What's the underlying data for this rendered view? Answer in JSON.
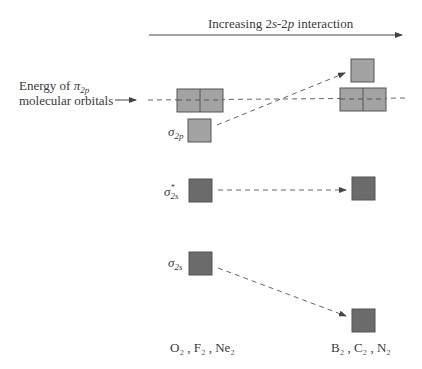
{
  "header": {
    "axis_label_prefix": "Increasing 2",
    "axis_label_s": "s",
    "axis_label_mid": "-2",
    "axis_label_p": "p",
    "axis_label_suffix": " interaction"
  },
  "left_label": {
    "line1_prefix": "Energy of ",
    "line1_symbol": "π",
    "line1_sub": "2p",
    "line2": "molecular orbitals"
  },
  "orbitals": {
    "sigma_2p": {
      "symbol": "σ",
      "sub": "2p"
    },
    "sigma_star_2s": {
      "symbol": "σ",
      "sup": "*",
      "sub": "2s"
    },
    "sigma_2s": {
      "symbol": "σ",
      "sub": "2s"
    }
  },
  "columns": {
    "left": "O₂ , F₂ , Ne₂",
    "right": "B₂ , C₂ , N₂"
  },
  "colors": {
    "light_box": "#a3a3a3",
    "dark_box": "#6b6b6b",
    "box_border": "#555555",
    "dash": "#666666",
    "text": "#3a3a3a"
  }
}
